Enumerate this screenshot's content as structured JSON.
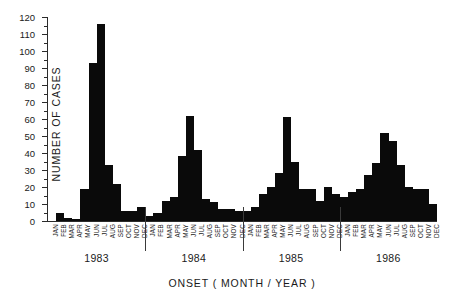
{
  "chart_data": {
    "type": "bar",
    "title": "",
    "xlabel": "ONSET ( MONTH / YEAR )",
    "ylabel": "NUMBER OF CASES",
    "ylim": [
      0,
      120
    ],
    "ytick_step": 10,
    "yminor_step": 5,
    "grid": false,
    "legend": null,
    "xtick_labels": [
      "JAN",
      "FEB",
      "MAR",
      "APR",
      "MAY",
      "JUN",
      "JUL",
      "AUG",
      "SEP",
      "OCT",
      "NOV",
      "DEC",
      "JAN",
      "FEB",
      "MAR",
      "APR",
      "MAY",
      "JUN",
      "JUL",
      "AUG",
      "SEP",
      "OCT",
      "NOV",
      "DEC",
      "JAN",
      "FEB",
      "MAR",
      "APR",
      "MAY",
      "JUN",
      "JUL",
      "AUG",
      "SEP",
      "OCT",
      "NOV",
      "DEC",
      "JAN",
      "FEB",
      "MAR",
      "APR",
      "MAY",
      "JUN",
      "JUL",
      "AUG",
      "SEP",
      "OCT",
      "NOV",
      "DEC"
    ],
    "ytick_labels": [
      "0",
      "10",
      "20",
      "30",
      "40",
      "50",
      "60",
      "70",
      "80",
      "90",
      "100",
      "110",
      "120"
    ],
    "group_labels": [
      "1983",
      "1984",
      "1985",
      "1986"
    ],
    "categories": [
      "JAN 1983",
      "FEB 1983",
      "MAR 1983",
      "APR 1983",
      "MAY 1983",
      "JUN 1983",
      "JUL 1983",
      "AUG 1983",
      "SEP 1983",
      "OCT 1983",
      "NOV 1983",
      "DEC 1983",
      "JAN 1984",
      "FEB 1984",
      "MAR 1984",
      "APR 1984",
      "MAY 1984",
      "JUN 1984",
      "JUL 1984",
      "AUG 1984",
      "SEP 1984",
      "OCT 1984",
      "NOV 1984",
      "DEC 1984",
      "JAN 1985",
      "FEB 1985",
      "MAR 1985",
      "APR 1985",
      "MAY 1985",
      "JUN 1985",
      "JUL 1985",
      "AUG 1985",
      "SEP 1985",
      "OCT 1985",
      "NOV 1985",
      "DEC 1985",
      "JAN 1986",
      "FEB 1986",
      "MAR 1986",
      "APR 1986",
      "MAY 1986",
      "JUN 1986",
      "JUL 1986",
      "AUG 1986",
      "SEP 1986",
      "OCT 1986",
      "NOV 1986",
      "DEC 1986"
    ],
    "values": [
      0,
      5,
      2,
      1,
      19,
      93,
      116,
      33,
      22,
      6,
      6,
      8,
      3,
      5,
      12,
      14,
      38,
      62,
      42,
      13,
      11,
      7,
      7,
      6,
      6,
      8,
      16,
      20,
      28,
      61,
      35,
      19,
      19,
      12,
      20,
      16,
      14,
      17,
      19,
      27,
      34,
      52,
      47,
      33,
      20,
      19,
      19,
      10
    ],
    "bar_color": "#0a0a0a",
    "axis_color": "#2b2b2b"
  }
}
